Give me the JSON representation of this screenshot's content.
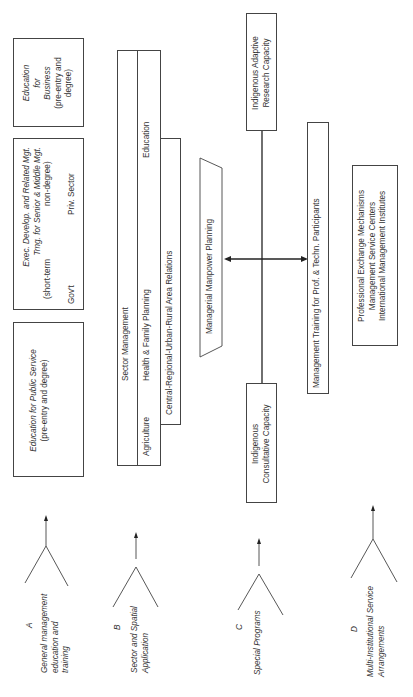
{
  "boxes": {
    "education_business": [
      "Education",
      "for",
      "Business",
      "(pre-entry and",
      "degree)"
    ],
    "exec_develop": {
      "lines": [
        "Exec. Develop. and Related Mgt.",
        "Trng. for Senior & Middle Mgt."
      ],
      "short_term": "(short-term",
      "non_degree": "non-degree)",
      "govt": "Gov't",
      "priv": "Priv. Sector"
    },
    "education_public": [
      "Education for Public Service",
      "(pre-entry and degree)"
    ]
  },
  "sector": {
    "title": "Sector Management",
    "items": [
      "Agriculture",
      "Health & Family Planning",
      "Education"
    ],
    "relations": "Central-Regional-Urban-Rural Area Relations"
  },
  "center": {
    "manpower": "Managerial Manpower Planning",
    "adaptive": [
      "Indigenous Adaptive",
      "Research Capacity"
    ],
    "consultative": [
      "Indigenous",
      "Consultative Capacity"
    ],
    "mgmt_training": "Management Training for Prof. & Techn. Participants",
    "exchange": [
      "Professional Exchange Mechanisms",
      "Management Service Centers",
      "International Management Institutes"
    ]
  },
  "categories": [
    {
      "letter": "A",
      "lines": [
        "General management",
        "education and",
        "training"
      ]
    },
    {
      "letter": "B",
      "lines": [
        "Sector and Spatial",
        "Application"
      ]
    },
    {
      "letter": "C",
      "lines": [
        "Special Programs"
      ]
    },
    {
      "letter": "D",
      "lines": [
        "Multi-Institutional Service",
        "Arrangements"
      ]
    }
  ]
}
